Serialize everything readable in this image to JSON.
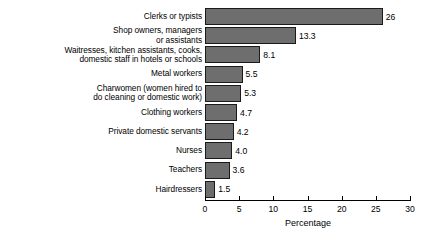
{
  "chart_data": {
    "type": "bar",
    "orientation": "horizontal",
    "title": "",
    "xlabel": "Percentage",
    "ylabel": "",
    "xlim": [
      0,
      30
    ],
    "xticks": [
      0,
      5,
      10,
      15,
      20,
      25,
      30
    ],
    "grid": false,
    "legend": false,
    "bar_color": "#6e6e6e",
    "bar_border_color": "#1a1a1a",
    "categories": [
      "Clerks or typists",
      "Shop owners, managers\nor assistants",
      "Waitresses, kitchen assistants, cooks,\ndomestic staff in hotels or schools",
      "Metal workers",
      "Charwomen (women hired to\ndo cleaning or domestic work)",
      "Clothing workers",
      "Private domestic servants",
      "Nurses",
      "Teachers",
      "Hairdressers"
    ],
    "values": [
      26,
      13.3,
      8.1,
      5.5,
      5.3,
      4.7,
      4.2,
      4.0,
      3.6,
      1.5
    ],
    "value_labels": [
      "26",
      "13.3",
      "8.1",
      "5.5",
      "5.3",
      "4.7",
      "4.2",
      "4.0",
      "3.6",
      "1.5"
    ]
  }
}
